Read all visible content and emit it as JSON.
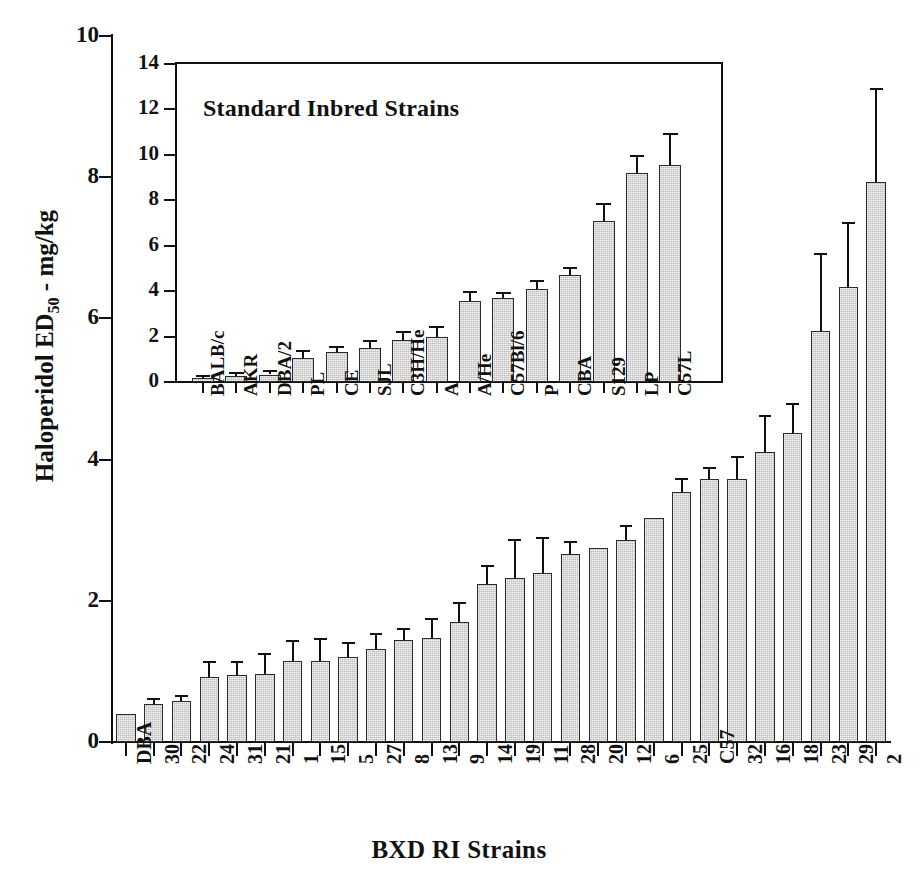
{
  "figure": {
    "ylabel_main": "Haloperidol ED",
    "ylabel_main_sub": "50",
    "ylabel_main_tail": " - mg/kg",
    "xlabel_main": "BXD RI Strains",
    "inset_title": "Standard Inbred Strains",
    "bar_fill": "#bcbcbc",
    "bar_stroke": "#2b2b2b",
    "axis_color": "#111111"
  },
  "chart_data": [
    {
      "type": "bar",
      "id": "main",
      "title": "",
      "xlabel": "BXD RI Strains",
      "ylabel": "Haloperidol ED50 - mg/kg",
      "ylim": [
        0,
        10
      ],
      "yticks": [
        0,
        2,
        4,
        6,
        8,
        10
      ],
      "grid": false,
      "legend": "none",
      "errorbars": "upper-only (SEM)",
      "categories": [
        "DBA",
        "30",
        "22",
        "24",
        "31",
        "21",
        "1",
        "15",
        "5",
        "27",
        "8",
        "13",
        "9",
        "14",
        "19",
        "11",
        "28",
        "20",
        "12",
        "6",
        "25",
        "C57",
        "32",
        "16",
        "18",
        "23",
        "29",
        "2"
      ],
      "values": [
        0.4,
        0.54,
        0.58,
        0.92,
        0.95,
        0.97,
        1.15,
        1.15,
        1.21,
        1.32,
        1.44,
        1.47,
        1.7,
        2.24,
        2.33,
        2.4,
        2.66,
        2.75,
        2.86,
        3.17,
        3.54,
        3.72,
        3.73,
        4.11,
        4.37,
        5.82,
        6.44,
        7.93
      ],
      "errors": [
        0.0,
        0.09,
        0.09,
        0.23,
        0.2,
        0.29,
        0.3,
        0.32,
        0.2,
        0.22,
        0.18,
        0.28,
        0.28,
        0.27,
        0.55,
        0.5,
        0.18,
        0.0,
        0.22,
        0.0,
        0.2,
        0.18,
        0.32,
        0.52,
        0.43,
        1.1,
        0.93,
        1.33
      ]
    },
    {
      "type": "bar",
      "id": "inset",
      "title": "Standard Inbred Strains",
      "xlabel": "",
      "ylabel": "",
      "ylim": [
        0,
        14
      ],
      "yticks": [
        0,
        2,
        4,
        6,
        8,
        10,
        12,
        14
      ],
      "grid": false,
      "legend": "none",
      "errorbars": "upper-only (SEM)",
      "categories": [
        "BALB/c",
        "AKR",
        "DBA/2",
        "PL",
        "CE",
        "SJL",
        "C3H/He",
        "A",
        "A/He",
        "C57Bl/6",
        "P",
        "CBA",
        "S129",
        "LP",
        "C57L"
      ],
      "values": [
        0.18,
        0.28,
        0.33,
        1.05,
        1.32,
        1.5,
        1.85,
        1.98,
        3.55,
        3.68,
        4.1,
        4.72,
        7.1,
        9.2,
        9.55
      ],
      "errors": [
        0.15,
        0.18,
        0.2,
        0.35,
        0.25,
        0.35,
        0.38,
        0.48,
        0.45,
        0.28,
        0.4,
        0.35,
        0.78,
        0.78,
        1.4
      ]
    }
  ]
}
